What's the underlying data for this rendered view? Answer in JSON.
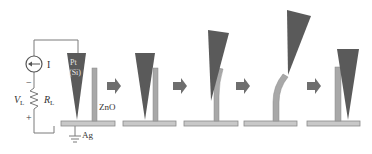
{
  "diagram": {
    "type": "process-sequence",
    "circuit": {
      "current_source_label": "I",
      "resistor_label": "R",
      "resistor_sub": "L",
      "voltage_label": "V",
      "voltage_sub": "L",
      "minus_sign": "−",
      "plus_sign": "+"
    },
    "materials": {
      "tip_label_line1": "Pt",
      "tip_label_line2": "(Si)",
      "nanowire_label": "ZnO",
      "substrate_label": "Ag"
    },
    "colors": {
      "tip": "#5a5a5a",
      "nanowire": "#a8a8a8",
      "substrate": "#c8c8c8",
      "arrow": "#6e6e6e",
      "wire": "#7a7a7a"
    },
    "steps": 5
  }
}
